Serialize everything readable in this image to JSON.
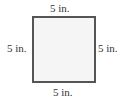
{
  "figure": {
    "shape": "square",
    "fill_color": "#f5f5f5",
    "stroke_color": "#555555",
    "labels": {
      "top": "5 in.",
      "left": "5 in.",
      "right": "5 in.",
      "bottom": "5 in."
    }
  }
}
